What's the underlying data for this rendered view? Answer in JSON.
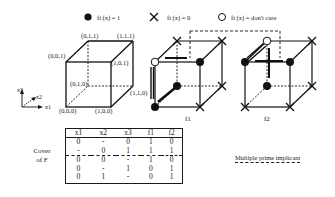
{
  "legend": {
    "on": "fi (x) = 1",
    "off": "fi (x) = 0",
    "dc": "fi (x) = don't care"
  },
  "axes": {
    "x1": "x1",
    "x2": "x2",
    "x3": "x3"
  },
  "cube_labels": {
    "v000": "(0,0,0)",
    "v100": "(1,0,0)",
    "v010": "(0,1,0)",
    "v110": "(1,1,0)",
    "v001": "(0,0,1)",
    "v101": "(1,0,1)",
    "v011": "(0,1,1)",
    "v111": "(1,1,1)"
  },
  "functions": {
    "f1": {
      "label": "f1",
      "v000": "1",
      "v100": "0",
      "v010": "1",
      "v110": "0",
      "v001": "dc",
      "v101": "1",
      "v011": "0",
      "v111": "0"
    },
    "f2": {
      "label": "f2",
      "v000": "0",
      "v100": "0",
      "v010": "1",
      "v110": "0",
      "v001": "1",
      "v101": "1",
      "v011": "dc",
      "v111": "0"
    }
  },
  "table": {
    "side_label_line1": "Cover",
    "side_label_line2": "of F",
    "headers": [
      "x1",
      "x2",
      "x3",
      "f1",
      "f2"
    ],
    "rows": [
      [
        "0",
        "-",
        "0",
        "1",
        "0"
      ],
      [
        "-",
        "0",
        "1",
        "1",
        "1"
      ],
      [
        "0",
        "0",
        "-",
        "1",
        "0"
      ],
      [
        "0",
        "-",
        "1",
        "0",
        "1"
      ],
      [
        "0",
        "1",
        "-",
        "0",
        "1"
      ]
    ],
    "multiple_prime_implicant_row": 1
  },
  "annotation": "Multiple prime implicant"
}
